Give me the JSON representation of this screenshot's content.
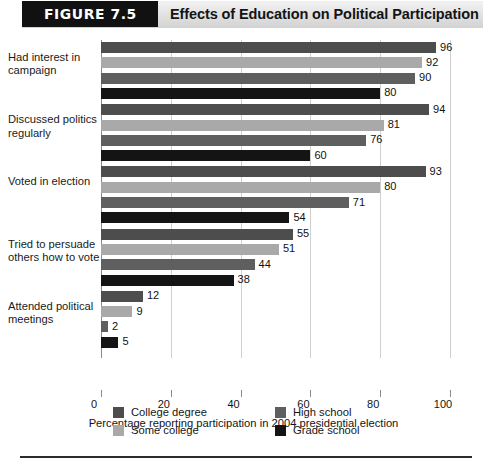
{
  "figure": {
    "badge_label": "FIGURE 7.5",
    "title": "Effects of Education on Political Participation"
  },
  "chart_data": {
    "type": "bar",
    "orientation": "horizontal",
    "title": "Effects of Education on Political Participation",
    "xlabel": "Percentage reporting participation in 2004 presidential election",
    "ylabel": "",
    "xlim": [
      0,
      100
    ],
    "xticks": [
      0,
      20,
      40,
      60,
      80,
      100
    ],
    "grid": true,
    "legend_position": "bottom",
    "categories": [
      "Had interest in campaign",
      "Discussed politics regularly",
      "Voted in election",
      "Tried to persuade others how to vote",
      "Attended political meetings"
    ],
    "series": [
      {
        "name": "College degree",
        "color": "#4d4d4d",
        "values": [
          96,
          94,
          93,
          55,
          12
        ]
      },
      {
        "name": "Some college",
        "color": "#a9a9a9",
        "values": [
          92,
          81,
          80,
          51,
          9
        ]
      },
      {
        "name": "High school",
        "color": "#5f5f5f",
        "values": [
          90,
          76,
          71,
          44,
          2
        ]
      },
      {
        "name": "Grade school",
        "color": "#141414",
        "values": [
          80,
          60,
          54,
          38,
          5
        ]
      }
    ]
  },
  "axis": {
    "x_label": "Percentage reporting participation in 2004 presidential election",
    "tick_labels": [
      "0",
      "20",
      "40",
      "60",
      "80",
      "100"
    ]
  },
  "legend": {
    "items": [
      {
        "label": "College degree",
        "color": "#4d4d4d"
      },
      {
        "label": "High school",
        "color": "#5f5f5f"
      },
      {
        "label": "Some college",
        "color": "#a9a9a9"
      },
      {
        "label": "Grade school",
        "color": "#141414"
      }
    ]
  }
}
